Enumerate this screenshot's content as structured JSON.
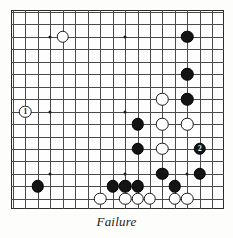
{
  "figure": {
    "caption": "Failure",
    "kind": "go-board-diagram"
  },
  "board": {
    "cols": 17,
    "rows": 16,
    "cell": 12.45,
    "origin_x": 2,
    "origin_y": 2,
    "line_color": "#4a4a4a",
    "border_color": "#2b2b2b",
    "background": "#fefefe",
    "star_points": [
      {
        "col": 3,
        "row": 2
      },
      {
        "col": 9,
        "row": 2
      },
      {
        "col": 3,
        "row": 8
      },
      {
        "col": 9,
        "row": 8
      },
      {
        "col": 3,
        "row": 13
      },
      {
        "col": 9,
        "row": 13
      },
      {
        "col": 14,
        "row": 13
      }
    ]
  },
  "stones": [
    {
      "id": "w-top-left",
      "color": "white",
      "col": 4,
      "row": 2,
      "label": ""
    },
    {
      "id": "b-top-right",
      "color": "black",
      "col": 14,
      "row": 2,
      "label": ""
    },
    {
      "id": "b-right-upper",
      "color": "black",
      "col": 14,
      "row": 5,
      "label": ""
    },
    {
      "id": "w-move-1",
      "color": "white",
      "col": 1,
      "row": 8,
      "label": "1"
    },
    {
      "id": "w-upper-mid",
      "color": "white",
      "col": 12,
      "row": 7,
      "label": ""
    },
    {
      "id": "b-right-mid",
      "color": "black",
      "col": 14,
      "row": 7,
      "label": ""
    },
    {
      "id": "b-center-upper",
      "color": "black",
      "col": 10,
      "row": 9,
      "label": ""
    },
    {
      "id": "w-center-upper",
      "color": "white",
      "col": 12,
      "row": 9,
      "label": ""
    },
    {
      "id": "w-right-9",
      "color": "white",
      "col": 14,
      "row": 9,
      "label": ""
    },
    {
      "id": "b-center-lower",
      "color": "black",
      "col": 10,
      "row": 11,
      "label": ""
    },
    {
      "id": "w-center-lower",
      "color": "white",
      "col": 12,
      "row": 11,
      "label": ""
    },
    {
      "id": "b-move-2",
      "color": "black",
      "col": 15,
      "row": 11,
      "label": "2"
    },
    {
      "id": "b-low-right-a",
      "color": "black",
      "col": 12,
      "row": 13,
      "label": ""
    },
    {
      "id": "b-low-right-b",
      "color": "black",
      "col": 15,
      "row": 13,
      "label": ""
    },
    {
      "id": "b-left-low",
      "color": "black",
      "col": 2,
      "row": 14,
      "label": ""
    },
    {
      "id": "b-bottom-a",
      "color": "black",
      "col": 8,
      "row": 14,
      "label": ""
    },
    {
      "id": "b-bottom-b",
      "color": "black",
      "col": 9,
      "row": 14,
      "label": ""
    },
    {
      "id": "b-bottom-c",
      "color": "black",
      "col": 10,
      "row": 14,
      "label": ""
    },
    {
      "id": "b-bottom-d",
      "color": "black",
      "col": 13,
      "row": 14,
      "label": ""
    },
    {
      "id": "w-bottom-a",
      "color": "white",
      "col": 7,
      "row": 15,
      "label": ""
    },
    {
      "id": "w-bottom-b",
      "color": "white",
      "col": 9,
      "row": 15,
      "label": ""
    },
    {
      "id": "w-bottom-c",
      "color": "white",
      "col": 10,
      "row": 15,
      "label": ""
    },
    {
      "id": "w-bottom-d",
      "color": "white",
      "col": 11,
      "row": 15,
      "label": ""
    },
    {
      "id": "w-bottom-e",
      "color": "white",
      "col": 13,
      "row": 15,
      "label": ""
    },
    {
      "id": "w-bottom-f",
      "color": "white",
      "col": 14,
      "row": 15,
      "label": ""
    }
  ]
}
